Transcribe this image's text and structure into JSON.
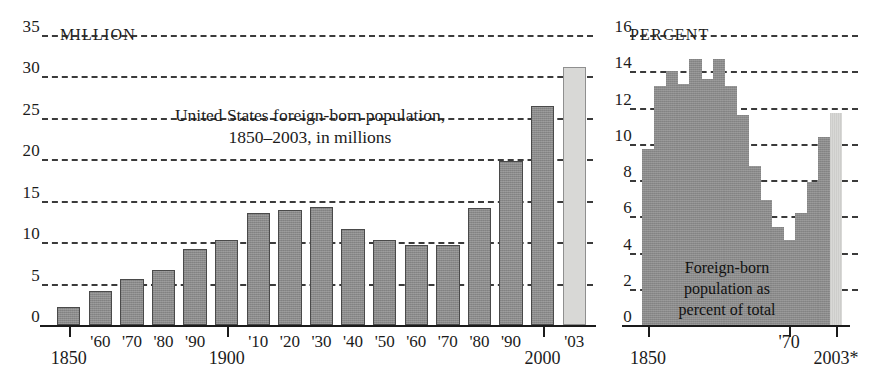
{
  "chart_data": [
    {
      "type": "bar",
      "id": "foreign-born-population-millions",
      "title": "United States foreign-born population, 1850–2003, in millions",
      "title_lines": [
        "United States foreign-born population,",
        "1850–2003, in millions"
      ],
      "unit_label": "MILLION",
      "axis_top_label": "35",
      "xlabel": "",
      "ylabel": "MILLION",
      "ylim": [
        0,
        35
      ],
      "ytick_step": 5,
      "yticks": [
        0,
        5,
        10,
        15,
        20,
        25,
        30,
        35
      ],
      "ytick_labels": [
        "0",
        "5",
        "10",
        "15",
        "20",
        "25",
        "30",
        "35"
      ],
      "grid": true,
      "grid_style": "dashed-horizontal",
      "categories": [
        "1850",
        "'60",
        "'70",
        "'80",
        "'90",
        "1900",
        "'10",
        "'20",
        "'30",
        "'40",
        "'50",
        "'60",
        "'70",
        "'80",
        "'90",
        "2000",
        "'03"
      ],
      "values": [
        2.2,
        4.1,
        5.6,
        6.7,
        9.2,
        10.3,
        13.5,
        13.9,
        14.2,
        11.6,
        10.3,
        9.7,
        9.6,
        14.1,
        19.8,
        26.4,
        31.1
      ],
      "bar_colors": [
        "#8a8a8a",
        "#8a8a8a",
        "#8a8a8a",
        "#8a8a8a",
        "#8a8a8a",
        "#8a8a8a",
        "#8a8a8a",
        "#8a8a8a",
        "#8a8a8a",
        "#8a8a8a",
        "#8a8a8a",
        "#8a8a8a",
        "#8a8a8a",
        "#8a8a8a",
        "#8a8a8a",
        "#8a8a8a",
        "#d8d8d6"
      ],
      "highlight_last": true,
      "xtick_major_labels": [
        {
          "label": "1850",
          "index": 0
        },
        {
          "label": "1900",
          "index": 5
        },
        {
          "label": "2000",
          "index": 15
        }
      ],
      "xtick_minor_labels": [
        "'60",
        "'70",
        "'80",
        "'90",
        "'10",
        "'20",
        "'30",
        "'40",
        "'50",
        "'60",
        "'70",
        "'80",
        "'90",
        "'03"
      ]
    },
    {
      "type": "area",
      "id": "foreign-born-percent-of-total",
      "title": "Foreign-born population as percent of total",
      "title_lines": [
        "Foreign-born",
        "population as",
        "percent of total"
      ],
      "unit_label": "PERCENT",
      "axis_top_label": "16",
      "xlabel": "",
      "ylabel": "PERCENT",
      "ylim": [
        0,
        16
      ],
      "ytick_step": 2,
      "yticks": [
        0,
        2,
        4,
        6,
        8,
        10,
        12,
        14,
        16
      ],
      "ytick_labels": [
        "0",
        "2",
        "4",
        "6",
        "8",
        "10",
        "12",
        "14",
        "16"
      ],
      "grid": true,
      "grid_style": "dashed-horizontal",
      "categories": [
        "1850",
        "1860",
        "1870",
        "1880",
        "1890",
        "1900",
        "1910",
        "1920",
        "1930",
        "1940",
        "1950",
        "1960",
        "1970",
        "1980",
        "1990",
        "2000",
        "2003"
      ],
      "values": [
        9.7,
        13.2,
        14.0,
        13.3,
        14.7,
        13.6,
        14.7,
        13.2,
        11.6,
        8.8,
        6.9,
        5.4,
        4.7,
        6.2,
        7.9,
        10.4,
        11.7
      ],
      "step_colors": [
        "#8a8a8a",
        "#8a8a8a",
        "#8a8a8a",
        "#8a8a8a",
        "#8a8a8a",
        "#8a8a8a",
        "#8a8a8a",
        "#8a8a8a",
        "#8a8a8a",
        "#8a8a8a",
        "#8a8a8a",
        "#8a8a8a",
        "#8a8a8a",
        "#8a8a8a",
        "#8a8a8a",
        "#8a8a8a",
        "#d8d8d6"
      ],
      "highlight_last": true,
      "xtick_major_labels": [
        {
          "label": "1850",
          "index": 0
        },
        {
          "label": "'70",
          "index": 12
        },
        {
          "label": "2003*",
          "index": 16
        }
      ]
    }
  ],
  "left_chart": {
    "unit_label": "MILLION",
    "top_value": "35",
    "title_line_1": "United States foreign-born population,",
    "title_line_2": "1850–2003, in millions",
    "y_labels": [
      "35",
      "30",
      "25",
      "20",
      "15",
      "10",
      "5",
      "0"
    ],
    "x_labels_minor": [
      "'60",
      "'70",
      "'80",
      "'90",
      "'10",
      "'20",
      "'30",
      "'40",
      "'50",
      "'60",
      "'70",
      "'80",
      "'90",
      "'03"
    ],
    "x_label_1850": "1850",
    "x_label_1900": "1900",
    "x_label_2000": "2000"
  },
  "right_chart": {
    "unit_label": "PERCENT",
    "top_value": "16",
    "title_line_1": "Foreign-born",
    "title_line_2": "population as",
    "title_line_3": "percent of total",
    "y_labels": [
      "16",
      "14",
      "12",
      "10",
      "8",
      "6",
      "4",
      "2",
      "0"
    ],
    "x_label_1850": "1850",
    "x_label_70": "'70",
    "x_label_2003": "2003*"
  },
  "colors": {
    "bar_dark": "#8a8a8a",
    "bar_light": "#d8d8d6",
    "ink": "#1b1b1b",
    "background": "#ffffff"
  }
}
